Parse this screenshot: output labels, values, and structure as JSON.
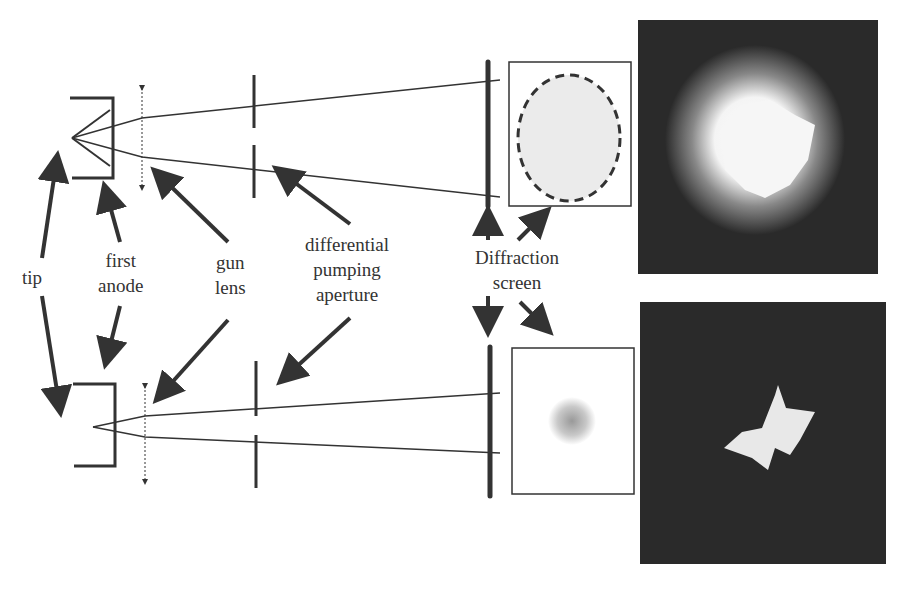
{
  "labels": {
    "tip": "tip",
    "first_anode": [
      "first",
      "anode"
    ],
    "gun_lens": [
      "gun",
      "lens"
    ],
    "differential_pumping_aperture": [
      "differential",
      "pumping",
      "aperture"
    ],
    "diffraction_screen": [
      "Diffraction",
      "screen"
    ]
  },
  "panels": {
    "top": {
      "description": "large diverging beam, dashed oval spot on screen",
      "photo": "bright diffuse blob"
    },
    "bottom": {
      "description": "focused beam, small spot on screen",
      "photo": "small bright star-shaped spot"
    }
  },
  "colors": {
    "line": "#333333",
    "photo_bg": "#2a2a2a",
    "spot_fill": "#e6e6e6"
  }
}
